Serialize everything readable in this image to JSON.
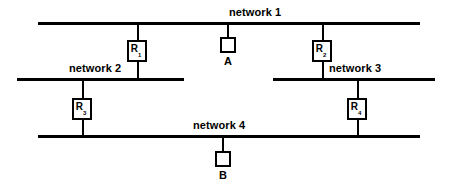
{
  "diagram": {
    "type": "network-topology",
    "width": 452,
    "height": 194,
    "background_color": "#ffffff",
    "line_color": "#000000",
    "networks": [
      {
        "id": "network-1",
        "label": "network 1",
        "x": 38,
        "y": 22,
        "length": 382,
        "label_x": 229,
        "label_y": 6
      },
      {
        "id": "network-2",
        "label": "network 2",
        "x": 17,
        "y": 78,
        "length": 167,
        "label_x": 105,
        "label_y": 62
      },
      {
        "id": "network-3",
        "label": "network 3",
        "x": 273,
        "y": 78,
        "length": 162,
        "label_x": 365,
        "label_y": 62
      },
      {
        "id": "network-4",
        "label": "network 4",
        "x": 38,
        "y": 135,
        "length": 382,
        "label_x": 229,
        "label_y": 119
      }
    ],
    "routers": [
      {
        "id": "router-1",
        "name": "R",
        "subscript": "1",
        "x": 127,
        "y": 40,
        "link_x": 137,
        "link_top": 22,
        "link_bottom": 78,
        "connects": [
          "network 1",
          "network 2"
        ]
      },
      {
        "id": "router-2",
        "name": "R",
        "subscript": "2",
        "x": 313,
        "y": 40,
        "link_x": 322,
        "link_top": 22,
        "link_bottom": 78,
        "connects": [
          "network 1",
          "network 3"
        ]
      },
      {
        "id": "router-3",
        "name": "R",
        "subscript": "3",
        "x": 73,
        "y": 98,
        "link_x": 82,
        "link_top": 78,
        "link_bottom": 135,
        "connects": [
          "network 2",
          "network 4"
        ]
      },
      {
        "id": "router-4",
        "name": "R",
        "subscript": "4",
        "x": 348,
        "y": 98,
        "link_x": 357,
        "link_top": 78,
        "link_bottom": 135,
        "connects": [
          "network 3",
          "network 4"
        ]
      }
    ],
    "hosts": [
      {
        "id": "host-a",
        "label": "A",
        "x": 220,
        "y": 37,
        "link_x": 227,
        "link_top": 22,
        "link_bottom": 37,
        "label_x": 222,
        "label_y": 56,
        "attached_to": "network 1"
      },
      {
        "id": "host-b",
        "label": "B",
        "x": 215,
        "y": 151,
        "link_x": 222,
        "link_top": 135,
        "link_bottom": 151,
        "label_x": 217,
        "label_y": 170,
        "attached_to": "network 4"
      }
    ]
  }
}
